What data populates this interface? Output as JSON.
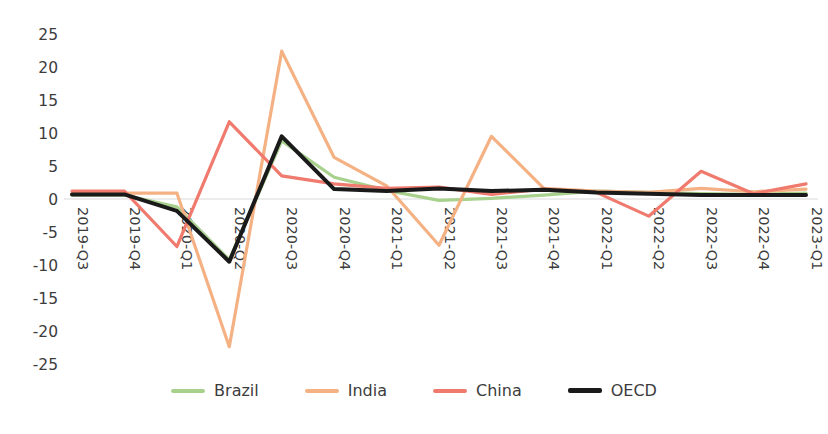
{
  "chart_data": {
    "type": "line",
    "title": "",
    "subtitle": "",
    "xlabel": "",
    "ylabel": "",
    "ylim": [
      -25,
      25
    ],
    "ytick_step": 5,
    "yticks": [
      25,
      20,
      15,
      10,
      5,
      0,
      -5,
      -10,
      -15,
      -20,
      -25
    ],
    "grid": false,
    "legend_position": "bottom",
    "categories": [
      "2019-Q3",
      "2019-Q4",
      "2020-Q1",
      "2020-Q2",
      "2020-Q3",
      "2020-Q4",
      "2021-Q1",
      "2021-Q2",
      "2021-Q3",
      "2021-Q4",
      "2022-Q1",
      "2022-Q2",
      "2022-Q3",
      "2022-Q4",
      "2023-Q1"
    ],
    "series": [
      {
        "name": "Brazil",
        "color": "#a9d18e",
        "width": 3.2,
        "values": [
          0.6,
          0.6,
          -1.2,
          -9.2,
          8.8,
          3.3,
          1.3,
          -0.2,
          0.1,
          0.6,
          1.2,
          1.0,
          0.8,
          0.7,
          0.9
        ]
      },
      {
        "name": "India",
        "color": "#f4b183",
        "width": 3.2,
        "values": [
          0.9,
          0.9,
          0.9,
          -22.4,
          22.4,
          6.3,
          2.0,
          -7.0,
          9.5,
          1.6,
          1.2,
          1.0,
          1.6,
          1.1,
          1.5
        ]
      },
      {
        "name": "China",
        "color": "#ef7a6d",
        "width": 3.2,
        "values": [
          1.2,
          1.2,
          -7.2,
          11.7,
          3.5,
          2.3,
          1.6,
          1.8,
          0.7,
          1.5,
          1.0,
          -2.6,
          4.2,
          0.8,
          2.3
        ]
      },
      {
        "name": "OECD",
        "color": "#1a1a1a",
        "width": 4.0,
        "values": [
          0.7,
          0.7,
          -1.8,
          -9.5,
          9.5,
          1.5,
          1.2,
          1.6,
          1.2,
          1.4,
          1.0,
          0.8,
          0.6,
          0.6,
          0.6
        ]
      }
    ]
  },
  "legend": {
    "items": [
      {
        "label": "Brazil",
        "color": "#a9d18e"
      },
      {
        "label": "India",
        "color": "#f4b183"
      },
      {
        "label": "China",
        "color": "#ef7a6d"
      },
      {
        "label": "OECD",
        "color": "#1a1a1a"
      }
    ]
  }
}
